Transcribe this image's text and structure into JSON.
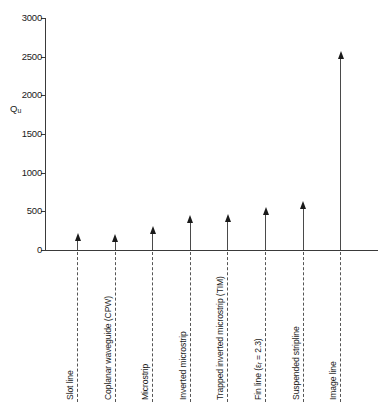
{
  "chart_data": {
    "type": "bar",
    "title": "",
    "subtitle": "",
    "xlabel": "",
    "ylabel": "Qu",
    "ylabel_base": "Q",
    "ylabel_sub": "u",
    "ylim": [
      0,
      3000
    ],
    "ytick_values": [
      0,
      500,
      1000,
      1500,
      2000,
      2500,
      3000
    ],
    "ytick_labels": [
      "0",
      "500",
      "1000",
      "1500",
      "2000",
      "2500",
      "3000"
    ],
    "grid": false,
    "legend": "none",
    "marker_style": "upward-arrow",
    "annotation": "Arrows indicate values are lower bounds",
    "categories": [
      "Slot line",
      "Coplanar waveguide (CPW)",
      "Microstrip",
      "Inverted microstrip",
      "Trapped inverted microstrip (TIM)",
      "Fin line (εr = 2.3)",
      "Suspended stripline",
      "Image line"
    ],
    "values": [
      130,
      110,
      225,
      360,
      380,
      460,
      540,
      2480
    ],
    "label_parts": [
      {
        "pre": "Slot line",
        "sub": "",
        "post": ""
      },
      {
        "pre": "Coplanar waveguide (CPW)",
        "sub": "",
        "post": ""
      },
      {
        "pre": "Microstrip",
        "sub": "",
        "post": ""
      },
      {
        "pre": "Inverted microstrip",
        "sub": "",
        "post": ""
      },
      {
        "pre": "Trapped inverted microstrip (TIM)",
        "sub": "",
        "post": ""
      },
      {
        "pre": "Fin line (ε",
        "sub": "r",
        "post": " = 2.3)"
      },
      {
        "pre": "Suspended stripline",
        "sub": "",
        "post": ""
      },
      {
        "pre": "Image line",
        "sub": "",
        "post": ""
      }
    ]
  },
  "colors": {
    "axis": "#3a3a3a",
    "stem": "#4a4a4a",
    "arrow": "#1a1a1a",
    "leader": "#555555",
    "text": "#1a1a1a",
    "background": "#ffffff"
  }
}
